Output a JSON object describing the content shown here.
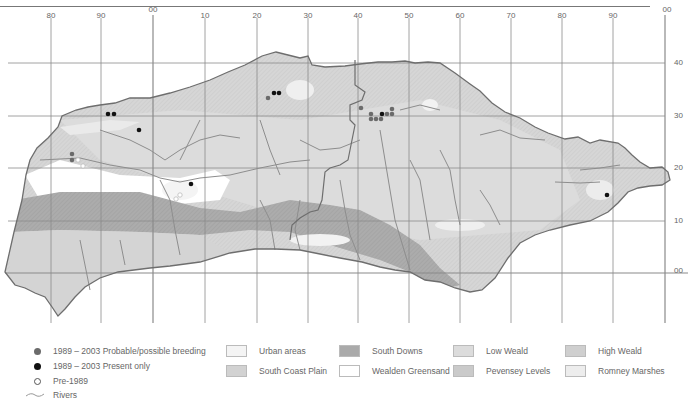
{
  "map": {
    "x_ticks": [
      {
        "label": "80",
        "x": 51
      },
      {
        "label": "90",
        "x": 101
      },
      {
        "label": "00",
        "x": 153
      },
      {
        "label": "10",
        "x": 205
      },
      {
        "label": "20",
        "x": 257
      },
      {
        "label": "30",
        "x": 308
      },
      {
        "label": "40",
        "x": 358
      },
      {
        "label": "50",
        "x": 409
      },
      {
        "label": "60",
        "x": 460
      },
      {
        "label": "70",
        "x": 511
      },
      {
        "label": "80",
        "x": 562
      },
      {
        "label": "90",
        "x": 613
      },
      {
        "label": "00",
        "x": 665
      }
    ],
    "y_ticks": [
      {
        "label": "40",
        "y": 63
      },
      {
        "label": "30",
        "y": 116
      },
      {
        "label": "20",
        "y": 168
      },
      {
        "label": "10",
        "y": 221
      },
      {
        "label": "00",
        "y": 273
      }
    ],
    "colors": {
      "grid": "#8a8a8a",
      "boundary": "#6e6e6e",
      "river": "#8d8d8d",
      "urban": "#f4f4f4",
      "south_coast_plain": "#d2d2d2",
      "south_downs": "#aaaaaa",
      "wealden_greensand": "#ffffff",
      "low_weald": "#dcdcdc",
      "high_weald": "#cfcfcf",
      "pevensey_levels": "#cacaca",
      "romney_marshes": "#ededed",
      "dot_breeding": "#6b6b6b",
      "dot_present": "#111111"
    },
    "records": {
      "breeding": [
        [
          72,
          154
        ],
        [
          72,
          159
        ],
        [
          269,
          97
        ],
        [
          356,
          111
        ],
        [
          363,
          114
        ],
        [
          363,
          118
        ],
        [
          368,
          118
        ],
        [
          373,
          118
        ],
        [
          373,
          114
        ],
        [
          378,
          114
        ],
        [
          383,
          114
        ],
        [
          383,
          111
        ],
        [
          378,
          111
        ]
      ],
      "present": [
        [
          108,
          114
        ],
        [
          113,
          114
        ],
        [
          139,
          130
        ],
        [
          191,
          183
        ],
        [
          274,
          93
        ],
        [
          279,
          93
        ],
        [
          372,
          114
        ],
        [
          608,
          195
        ]
      ],
      "pre1989": [
        [
          79,
          158
        ],
        [
          84,
          166
        ],
        [
          180,
          193
        ],
        [
          176,
          198
        ]
      ]
    }
  },
  "legend": {
    "symbols": [
      {
        "label": "1989 – 2003 Probable/possible breeding",
        "icon": "grey-dot-icon"
      },
      {
        "label": "1989 – 2003 Present only",
        "icon": "black-dot-icon"
      },
      {
        "label": "Pre-1989",
        "icon": "open-circle-icon"
      },
      {
        "label": "Rivers",
        "icon": "river-line-icon"
      }
    ],
    "habitats": [
      {
        "label": "Urban areas",
        "color": "#f4f4f4"
      },
      {
        "label": "South Coast Plain",
        "color": "#d2d2d2"
      },
      {
        "label": "South Downs",
        "color": "#aaaaaa"
      },
      {
        "label": "Wealden Greensand",
        "color": "#ffffff"
      },
      {
        "label": "Low Weald",
        "color": "#dcdcdc"
      },
      {
        "label": "Pevensey Levels",
        "color": "#cacaca"
      },
      {
        "label": "High Weald",
        "color": "#cfcfcf"
      },
      {
        "label": "Romney Marshes",
        "color": "#ededed"
      }
    ]
  }
}
